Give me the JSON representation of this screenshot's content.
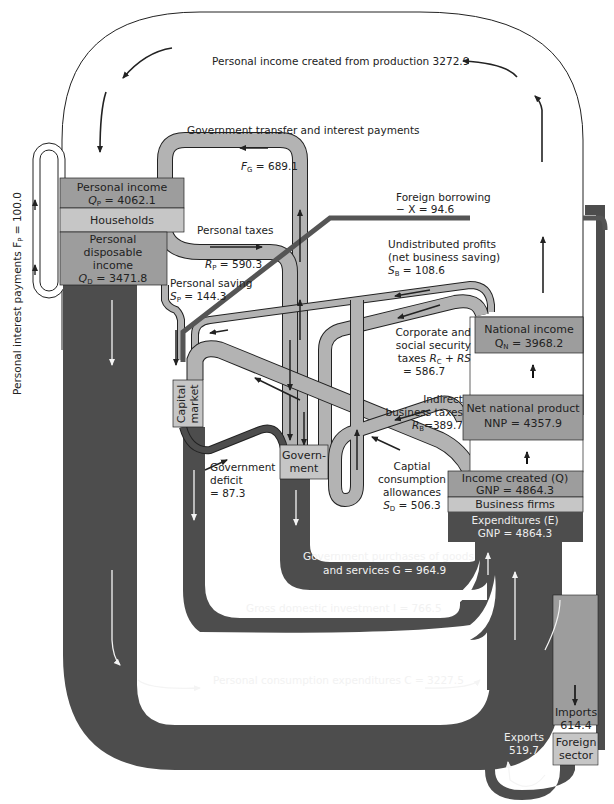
{
  "diagram": {
    "colors": {
      "light_flow": "#b3b3b3",
      "dark_flow": "#4d4d4d",
      "box_medium": "#9d9d9d",
      "box_light": "#c6c6c6",
      "outline": "#222222"
    },
    "outer_loop": {
      "label": "Personal income created from production 3272.9"
    },
    "personal_interest": {
      "label": "Personal interest payments F",
      "sub": "P",
      "value": " = 100.0"
    },
    "households": {
      "personal_income_label": "Personal income",
      "personal_income_symbol": "Q",
      "personal_income_sub": "P",
      "personal_income_value": " = 4062.1",
      "households_label": "Households",
      "pdi_line1": "Personal",
      "pdi_line2": "disposable",
      "pdi_line3": "income",
      "pdi_symbol": "Q",
      "pdi_sub": "D",
      "pdi_value": " = 3471.8"
    },
    "gov_transfer": {
      "label": "Government transfer and interest payments",
      "symbol": "F",
      "sub": "G",
      "value": " = 689.1"
    },
    "personal_taxes": {
      "label": "Personal taxes",
      "symbol": "R",
      "sub": "P",
      "value": " = 590.3"
    },
    "personal_saving": {
      "label": "Personal saving",
      "symbol": "S",
      "sub": "P",
      "value": " = 144.3"
    },
    "foreign_borrowing": {
      "label": "Foreign borrowing",
      "value": "− X = 94.6"
    },
    "undistributed_profits": {
      "line1": "Undistributed profits",
      "line2": "(net business saving)",
      "symbol": "S",
      "sub": "B",
      "value": " = 108.6"
    },
    "corporate_taxes": {
      "line1": "Corporate and",
      "line2": "social security",
      "line3_pre": "taxes ",
      "line3_sym": "R",
      "line3_sub": "C",
      "line3_post": " + RS",
      "line4": "= 586.7"
    },
    "indirect_taxes": {
      "line1": "Indirect",
      "line2": "business taxes",
      "symbol": "R",
      "sub": "B",
      "value": "=389.7"
    },
    "capital_consumption": {
      "line1": "Captial",
      "line2": "consumption",
      "line3": "allowances",
      "symbol": "S",
      "sub": "D",
      "value": " = 506.3"
    },
    "capital_market": {
      "line1": "Capital",
      "line2": "market"
    },
    "government": {
      "line1": "Govern-",
      "line2": "ment"
    },
    "gov_deficit": {
      "line1": "Government",
      "line2": "deficit",
      "line3": "= 87.3"
    },
    "national_income": {
      "label": "National income",
      "symbol": "Q",
      "sub": "N",
      "value": " = 3968.2"
    },
    "nnp": {
      "label": "Net national product",
      "value": "NNP = 4357.9"
    },
    "income_created": {
      "label": "Income created (Q)",
      "value": "GNP = 4864.3"
    },
    "business_firms": {
      "label": "Business firms"
    },
    "expenditures": {
      "label": "Expenditures (E)",
      "value": "GNP = 4864.3"
    },
    "gov_purchases": {
      "line1": "Government purchases of goods",
      "line2": "and services G = 964.9"
    },
    "investment": {
      "label": "Gross  domestic investment I = 766.5"
    },
    "consumption": {
      "label": "Personal consumption expenditures C = 3227.5"
    },
    "imports": {
      "label": "Imports",
      "value": "614.4"
    },
    "foreign_sector": {
      "line1": "Foreign",
      "line2": "sector"
    },
    "exports": {
      "label": "Exports",
      "value": "519.7"
    }
  }
}
